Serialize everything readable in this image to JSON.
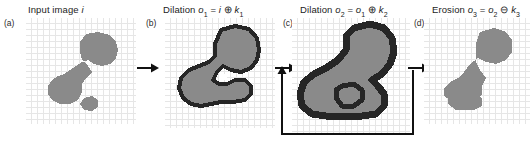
{
  "figure": {
    "type": "morphological-operations-diagram",
    "background": "#ffffff",
    "shape_fill": "#8a8a8a",
    "shape_outline": "#262626",
    "grid_color": "#e3e3e3",
    "arrow_color": "#111111"
  },
  "panels": [
    {
      "letter": "(a)",
      "caption_prefix": "Input image ",
      "caption_var": "i",
      "caption_sub": "",
      "caption_op": "",
      "caption_operand_a": "",
      "caption_operand_a_sub": "",
      "caption_operand_b": "",
      "caption_operand_b_sub": "",
      "has_outline": false,
      "title_full": "Input image i"
    },
    {
      "letter": "(b)",
      "caption_prefix": "Dilation ",
      "caption_var": "o",
      "caption_sub": "1",
      "caption_op": "⊕",
      "caption_operand_a": "i",
      "caption_operand_a_sub": "",
      "caption_operand_b": "k",
      "caption_operand_b_sub": "1",
      "has_outline": true,
      "title_full": "Dilation o1 = i ⊕ k1"
    },
    {
      "letter": "(c)",
      "caption_prefix": "Dilation  ",
      "caption_var": "o",
      "caption_sub": "2",
      "caption_op": "⊕",
      "caption_operand_a": "o",
      "caption_operand_a_sub": "1",
      "caption_operand_b": "k",
      "caption_operand_b_sub": "2",
      "has_outline": true,
      "title_full": "Dilation o2 = o1 ⊕ k2"
    },
    {
      "letter": "(d)",
      "caption_prefix": "Erosion ",
      "caption_var": "o",
      "caption_sub": "3",
      "caption_op": "⊖",
      "caption_operand_a": "o",
      "caption_operand_a_sub": "2",
      "caption_operand_b": "k",
      "caption_operand_b_sub": "3",
      "has_outline": false,
      "title_full": "Erosion o3 = o2 ⊖ k3"
    }
  ],
  "equals_sign": "=",
  "arrows": {
    "a_to_b": "arrow-right",
    "b_to_c": "arrow-right",
    "c_to_d": "arrow-right",
    "feedback_loop": "feedback-loop-c-to-c"
  }
}
